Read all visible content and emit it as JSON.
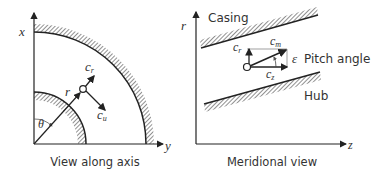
{
  "left_panel": {
    "caption": "View along axis",
    "axis_x": "x",
    "axis_y": "y",
    "radius_label": "r",
    "angle_label": "θ",
    "vector_cr": "c",
    "vector_cr_sub": "r",
    "vector_cu": "c",
    "vector_cu_sub": "u"
  },
  "right_panel": {
    "caption": "Meridional view",
    "axis_r": "r",
    "axis_z": "z",
    "casing_label": "Casing",
    "hub_label": "Hub",
    "vector_cr": "c",
    "vector_cr_sub": "r",
    "vector_cm": "c",
    "vector_cm_sub": "m",
    "vector_cz": "c",
    "vector_cz_sub": "z",
    "angle_symbol": "ε",
    "angle_label": "Pitch angle"
  },
  "colors": {
    "stroke": "#222222",
    "hatch": "#444444",
    "background": "#ffffff"
  }
}
